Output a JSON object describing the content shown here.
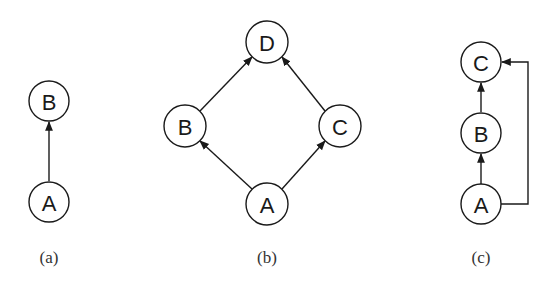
{
  "diagrams": [
    {
      "caption": "(a)",
      "nodes": [
        {
          "id": "A",
          "label": "A",
          "cx": 49,
          "cy": 202
        },
        {
          "id": "B",
          "label": "B",
          "cx": 49,
          "cy": 101
        }
      ],
      "edges": [
        {
          "from": "A",
          "to": "B"
        }
      ]
    },
    {
      "caption": "(b)",
      "nodes": [
        {
          "id": "A",
          "label": "A",
          "cx": 267,
          "cy": 204
        },
        {
          "id": "B",
          "label": "B",
          "cx": 185,
          "cy": 126
        },
        {
          "id": "C",
          "label": "C",
          "cx": 340,
          "cy": 126
        },
        {
          "id": "D",
          "label": "D",
          "cx": 267,
          "cy": 42
        }
      ],
      "edges": [
        {
          "from": "A",
          "to": "B"
        },
        {
          "from": "A",
          "to": "C"
        },
        {
          "from": "B",
          "to": "D"
        },
        {
          "from": "C",
          "to": "D"
        }
      ]
    },
    {
      "caption": "(c)",
      "nodes": [
        {
          "id": "A",
          "label": "A",
          "cx": 481,
          "cy": 204
        },
        {
          "id": "B",
          "label": "B",
          "cx": 481,
          "cy": 133
        },
        {
          "id": "C",
          "label": "C",
          "cx": 481,
          "cy": 62
        }
      ],
      "edges": [
        {
          "from": "A",
          "to": "B"
        },
        {
          "from": "B",
          "to": "C"
        },
        {
          "from": "A",
          "to": "C",
          "routing": "right-side-bracket"
        }
      ]
    }
  ],
  "style": {
    "stroke": "#1a1a1a",
    "fill": "#ffffff"
  }
}
